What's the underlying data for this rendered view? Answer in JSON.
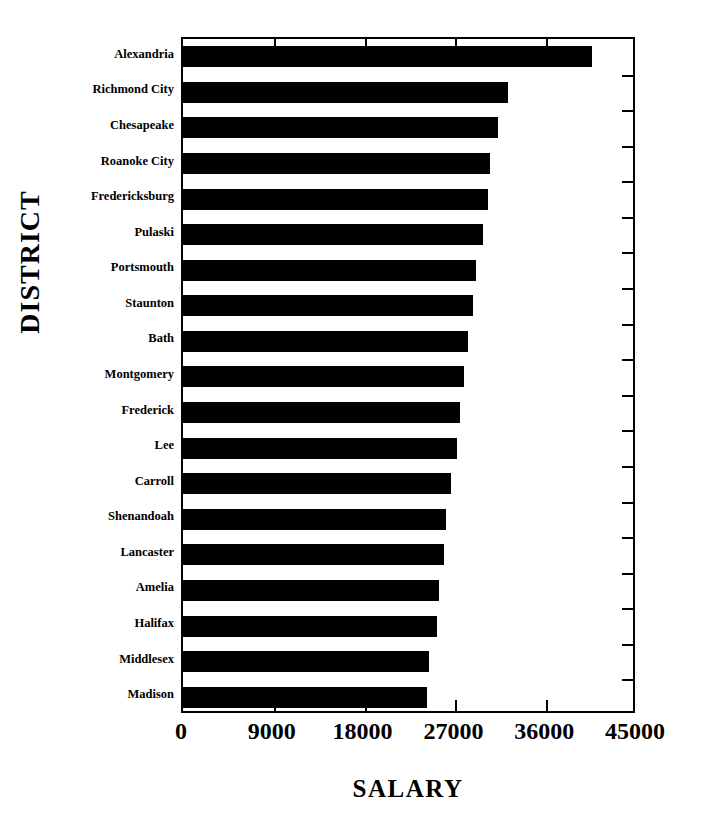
{
  "chart_data": {
    "type": "bar",
    "orientation": "horizontal",
    "title": "",
    "xlabel": "SALARY",
    "ylabel": "DISTRICT",
    "xlim": [
      0,
      45000
    ],
    "ylim": null,
    "grid": false,
    "legend": null,
    "xticks": [
      0,
      9000,
      18000,
      27000,
      36000,
      45000
    ],
    "xticklabels": [
      "0",
      "9000",
      "18000",
      "27000",
      "36000",
      "45000"
    ],
    "categories": [
      "Alexandria",
      "Richmond City",
      "Chesapeake",
      "Roanoke City",
      "Fredericksburg",
      "Pulaski",
      "Portsmouth",
      "Staunton",
      "Bath",
      "Montgomery",
      "Frederick",
      "Lee",
      "Carroll",
      "Shenandoah",
      "Lancaster",
      "Amelia",
      "Halifax",
      "Middlesex",
      "Madison"
    ],
    "values": [
      40500,
      32200,
      31200,
      30400,
      30200,
      29700,
      29000,
      28700,
      28200,
      27900,
      27500,
      27200,
      26600,
      26100,
      25900,
      25400,
      25200,
      24400,
      24200
    ],
    "bar_color": "#000000",
    "background_color": "#ffffff"
  },
  "axes": {
    "x_title": "SALARY",
    "y_title": "DISTRICT"
  }
}
